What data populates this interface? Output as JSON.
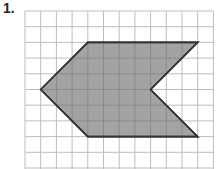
{
  "problem": {
    "number_label": "1."
  },
  "grid": {
    "origin_x": 25,
    "origin_y": 11,
    "cell": 15.7,
    "cols": 12,
    "rows": 10,
    "line_color": "#bdbdbd"
  },
  "shape": {
    "name": "arrow-chevron-hexagon",
    "fill": "#9a9a9a",
    "stroke": "#333333",
    "vertices_grid": [
      [
        1,
        5
      ],
      [
        4,
        2
      ],
      [
        11,
        2
      ],
      [
        8,
        5
      ],
      [
        11,
        8
      ],
      [
        4,
        8
      ]
    ]
  }
}
